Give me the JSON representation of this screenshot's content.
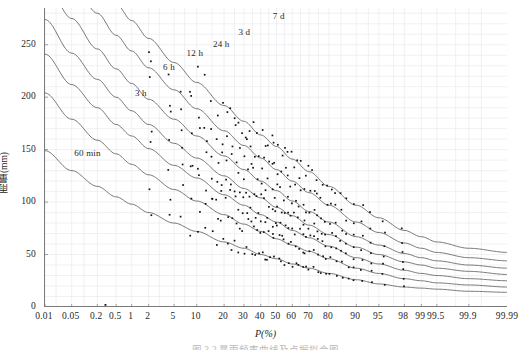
{
  "figure": {
    "caption": "图 3-2  暴雨频率曲线及点据拟合图",
    "background": "#ffffff"
  },
  "chart_data": {
    "type": "line",
    "title": "",
    "xlabel": "P(%)",
    "ylabel": "雨量(mm)",
    "xscale": "normal-probability",
    "grid": true,
    "grid_color": "#e8e8ec",
    "curve_color": "#555555",
    "point_color": "#111111",
    "legend_position": "inline-curve-labels",
    "ylim": [
      0,
      285
    ],
    "yticks": [
      0,
      50,
      100,
      150,
      200,
      250
    ],
    "ytick_labels": [
      "0",
      "50",
      "100",
      "150",
      "200",
      "250"
    ],
    "xticks": [
      0.01,
      0.05,
      0.2,
      0.5,
      1,
      2,
      5,
      10,
      20,
      30,
      40,
      50,
      60,
      70,
      80,
      90,
      95,
      98,
      99,
      99.5,
      99.9,
      99.99
    ],
    "xtick_labels": [
      "0.01",
      "0.05",
      "0.2",
      "0.5",
      "1",
      "2",
      "5",
      "10",
      "20",
      "30",
      "40",
      "50",
      "60",
      "70",
      "80",
      "90",
      "95",
      "98",
      "99",
      "99.5",
      "99.9",
      "99.99"
    ],
    "series": [
      {
        "name": "7 d",
        "label": "7 d",
        "label_x": 47.0,
        "label_y": 276.0,
        "params": {
          "y0": 390.0,
          "ymin": 52.0,
          "k": 0.0455
        },
        "x": [
          0.01,
          0.05,
          0.2,
          0.5,
          1,
          2,
          5,
          10,
          20,
          30,
          40,
          50,
          60,
          70,
          80,
          90,
          95,
          98,
          99,
          99.5,
          99.9,
          99.99
        ],
        "values": [
          386,
          344,
          311,
          289,
          273,
          256,
          233,
          214,
          192,
          177,
          164,
          153,
          141,
          129,
          115,
          97,
          85,
          73,
          67,
          62,
          56,
          52
        ]
      },
      {
        "name": "3 d",
        "label": "3 d",
        "label_x": 26.5,
        "label_y": 261.0,
        "params": {
          "y0": 352.0,
          "ymin": 44.0,
          "k": 0.0455
        },
        "x": [
          0.01,
          0.05,
          0.2,
          0.5,
          1,
          2,
          5,
          10,
          20,
          30,
          40,
          50,
          60,
          70,
          80,
          90,
          95,
          98,
          99,
          99.5,
          99.9,
          99.99
        ],
        "values": [
          350,
          311,
          280,
          259,
          244,
          228,
          207,
          189,
          168,
          154,
          142,
          131,
          120,
          109,
          97,
          81,
          71,
          61,
          56,
          52,
          47,
          44
        ]
      },
      {
        "name": "24 h",
        "label": "24 h",
        "label_x": 15.0,
        "label_y": 250.0,
        "params": {
          "y0": 312.0,
          "ymin": 37.0,
          "k": 0.0455
        },
        "x": [
          0.01,
          0.05,
          0.2,
          0.5,
          1,
          2,
          5,
          10,
          20,
          30,
          40,
          50,
          60,
          70,
          80,
          90,
          95,
          98,
          99,
          99.5,
          99.9,
          99.99
        ],
        "values": [
          310,
          275,
          246,
          227,
          213,
          198,
          179,
          163,
          144,
          131,
          120,
          111,
          101,
          91,
          81,
          67,
          59,
          51,
          47,
          44,
          40,
          37
        ]
      },
      {
        "name": "12 h",
        "label": "12 h",
        "label_x": 7.2,
        "label_y": 241.0,
        "params": {
          "y0": 276.0,
          "ymin": 31.0,
          "k": 0.0455
        },
        "x": [
          0.01,
          0.05,
          0.2,
          0.5,
          1,
          2,
          5,
          10,
          20,
          30,
          40,
          50,
          60,
          70,
          80,
          90,
          95,
          98,
          99,
          99.5,
          99.9,
          99.99
        ],
        "values": [
          274,
          242,
          217,
          200,
          187,
          174,
          156,
          142,
          125,
          113,
          104,
          95,
          87,
          78,
          69,
          57,
          50,
          43,
          40,
          37,
          34,
          31
        ]
      },
      {
        "name": "6 h",
        "label": "6 h",
        "label_x": 3.3,
        "label_y": 228.0,
        "params": {
          "y0": 243.0,
          "ymin": 25.0,
          "k": 0.0455
        },
        "x": [
          0.01,
          0.05,
          0.2,
          0.5,
          1,
          2,
          5,
          10,
          20,
          30,
          40,
          50,
          60,
          70,
          80,
          90,
          95,
          98,
          99,
          99.5,
          99.9,
          99.99
        ],
        "values": [
          241,
          212,
          190,
          174,
          163,
          151,
          135,
          123,
          107,
          97,
          88,
          81,
          73,
          66,
          58,
          47,
          41,
          35,
          32,
          30,
          27,
          25
        ]
      },
      {
        "name": "3 h",
        "label": "3 h",
        "label_x": 1.1,
        "label_y": 203.0,
        "params": {
          "y0": 206.0,
          "ymin": 19.0,
          "k": 0.0455
        },
        "x": [
          0.01,
          0.05,
          0.2,
          0.5,
          1,
          2,
          5,
          10,
          20,
          30,
          40,
          50,
          60,
          70,
          80,
          90,
          95,
          98,
          99,
          99.5,
          99.9,
          99.99
        ],
        "values": [
          204,
          179,
          159,
          146,
          136,
          126,
          112,
          101,
          88,
          79,
          72,
          65,
          59,
          53,
          46,
          37,
          32,
          27,
          25,
          23,
          21,
          19
        ]
      },
      {
        "name": "60 min",
        "label": "60 min",
        "label_x": 0.055,
        "label_y": 146.0,
        "params": {
          "y0": 150.0,
          "ymin": 14.0,
          "k": 0.0455
        },
        "x": [
          0.01,
          0.05,
          0.2,
          0.5,
          1,
          2,
          5,
          10,
          20,
          30,
          40,
          50,
          60,
          70,
          80,
          90,
          95,
          98,
          99,
          99.5,
          99.9,
          99.99
        ],
        "values": [
          149,
          130,
          115,
          105,
          98,
          90,
          80,
          72,
          62,
          56,
          50,
          46,
          41,
          37,
          32,
          26,
          22,
          19,
          18,
          17,
          15,
          14
        ]
      }
    ],
    "outlier_points": [
      {
        "x": 0.3,
        "y": 2
      }
    ],
    "scatter_note": "observed annual maxima plotted as small filled squares clustering along each fitted frequency curve"
  }
}
